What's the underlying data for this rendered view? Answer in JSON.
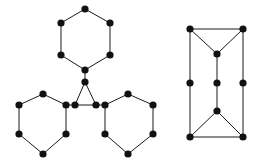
{
  "figure": {
    "background_color": "#ffffff",
    "node_color": "#111111",
    "edge_color": "#1a1a1a",
    "node_radius": 3.6,
    "edge_width": 1,
    "width": 262,
    "height": 161
  },
  "graphs": [
    {
      "id": "left-graph",
      "name": "triangle-with-three-hexagons",
      "label": "",
      "node_count": 21,
      "edge_count": 24,
      "nodes": [
        {
          "id": "h_top_1",
          "x": 85,
          "y": 9
        },
        {
          "id": "h_top_2",
          "x": 110,
          "y": 23
        },
        {
          "id": "h_top_3",
          "x": 110,
          "y": 55
        },
        {
          "id": "h_top_4",
          "x": 85,
          "y": 70
        },
        {
          "id": "h_top_5",
          "x": 61,
          "y": 55
        },
        {
          "id": "h_top_6",
          "x": 61,
          "y": 23
        },
        {
          "id": "tri_apex",
          "x": 85,
          "y": 82
        },
        {
          "id": "tri_left",
          "x": 75,
          "y": 105
        },
        {
          "id": "tri_right",
          "x": 96,
          "y": 105
        },
        {
          "id": "h_left_1",
          "x": 43,
          "y": 94
        },
        {
          "id": "h_left_2",
          "x": 66,
          "y": 105
        },
        {
          "id": "h_left_3",
          "x": 66,
          "y": 134
        },
        {
          "id": "h_left_4",
          "x": 43,
          "y": 154
        },
        {
          "id": "h_left_5",
          "x": 19,
          "y": 134
        },
        {
          "id": "h_left_6",
          "x": 19,
          "y": 105
        },
        {
          "id": "h_right_1",
          "x": 128,
          "y": 94
        },
        {
          "id": "h_right_2",
          "x": 153,
          "y": 105
        },
        {
          "id": "h_right_3",
          "x": 153,
          "y": 134
        },
        {
          "id": "h_right_4",
          "x": 128,
          "y": 154
        },
        {
          "id": "h_right_5",
          "x": 105,
          "y": 134
        },
        {
          "id": "h_right_6",
          "x": 105,
          "y": 105
        }
      ],
      "edges": [
        [
          "h_top_1",
          "h_top_2"
        ],
        [
          "h_top_2",
          "h_top_3"
        ],
        [
          "h_top_3",
          "h_top_4"
        ],
        [
          "h_top_4",
          "h_top_5"
        ],
        [
          "h_top_5",
          "h_top_6"
        ],
        [
          "h_top_6",
          "h_top_1"
        ],
        [
          "h_top_4",
          "tri_apex"
        ],
        [
          "tri_apex",
          "tri_left"
        ],
        [
          "tri_apex",
          "tri_right"
        ],
        [
          "tri_left",
          "tri_right"
        ],
        [
          "tri_left",
          "h_left_2"
        ],
        [
          "tri_right",
          "h_right_6"
        ],
        [
          "h_left_1",
          "h_left_2"
        ],
        [
          "h_left_2",
          "h_left_3"
        ],
        [
          "h_left_3",
          "h_left_4"
        ],
        [
          "h_left_4",
          "h_left_5"
        ],
        [
          "h_left_5",
          "h_left_6"
        ],
        [
          "h_left_6",
          "h_left_1"
        ],
        [
          "h_right_1",
          "h_right_2"
        ],
        [
          "h_right_2",
          "h_right_3"
        ],
        [
          "h_right_3",
          "h_right_4"
        ],
        [
          "h_right_4",
          "h_right_5"
        ],
        [
          "h_right_5",
          "h_right_6"
        ],
        [
          "h_right_6",
          "h_right_1"
        ]
      ]
    },
    {
      "id": "right-graph",
      "name": "rectangle-with-bowtie",
      "label": "",
      "node_count": 9,
      "edge_count": 12,
      "nodes": [
        {
          "id": "r_tl",
          "x": 190,
          "y": 29
        },
        {
          "id": "r_tr",
          "x": 243,
          "y": 29
        },
        {
          "id": "r_upper",
          "x": 217,
          "y": 54
        },
        {
          "id": "r_ml",
          "x": 190,
          "y": 83
        },
        {
          "id": "r_mc",
          "x": 217,
          "y": 83
        },
        {
          "id": "r_mr",
          "x": 243,
          "y": 83
        },
        {
          "id": "r_lower",
          "x": 217,
          "y": 111
        },
        {
          "id": "r_bl",
          "x": 190,
          "y": 137
        },
        {
          "id": "r_br",
          "x": 243,
          "y": 137
        }
      ],
      "edges": [
        [
          "r_tl",
          "r_tr"
        ],
        [
          "r_tl",
          "r_upper"
        ],
        [
          "r_tr",
          "r_upper"
        ],
        [
          "r_upper",
          "r_mc"
        ],
        [
          "r_tl",
          "r_ml"
        ],
        [
          "r_tr",
          "r_mr"
        ],
        [
          "r_ml",
          "r_bl"
        ],
        [
          "r_mr",
          "r_br"
        ],
        [
          "r_mc",
          "r_lower"
        ],
        [
          "r_lower",
          "r_bl"
        ],
        [
          "r_lower",
          "r_br"
        ],
        [
          "r_bl",
          "r_br"
        ]
      ]
    }
  ]
}
